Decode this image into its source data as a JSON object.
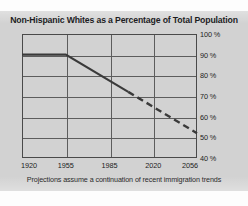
{
  "chart_data": {
    "type": "line",
    "title": "Non-Hispanic Whites as a Percentage of Total Population",
    "caption": "Projections assume a continuation of recent immigration trends",
    "xlabel": "",
    "ylabel": "",
    "xlim": [
      1920,
      2056
    ],
    "ylim": [
      40,
      100
    ],
    "grid": true,
    "legend": "none",
    "x_ticks": [
      1920,
      1955,
      1985,
      2020,
      2056
    ],
    "x_tick_labels": [
      "1920",
      "1955",
      "1985",
      "2020",
      "2056"
    ],
    "y_ticks": [
      100,
      90,
      80,
      70,
      60,
      50,
      40
    ],
    "y_tick_labels": [
      "100 %",
      "90 %",
      "80 %",
      "70 %",
      "60 %",
      "50 %",
      "40 %"
    ],
    "series": [
      {
        "name": "Historical (solid)",
        "style": "solid",
        "color": "#3a3a3a",
        "x": [
          1920,
          1955,
          2000
        ],
        "values": [
          90,
          90,
          72
        ]
      },
      {
        "name": "Projected (dashed)",
        "style": "dashed",
        "color": "#3a3a3a",
        "x": [
          2000,
          2056
        ],
        "values": [
          72,
          52
        ]
      }
    ]
  },
  "colors": {
    "page_background": "#d2d2d2",
    "line": "#3a3a3a",
    "grid": "#5d5d5d",
    "frame": "#4a4a4a",
    "text": "#1d1d1f"
  }
}
